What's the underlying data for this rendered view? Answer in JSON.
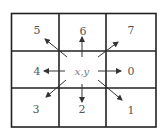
{
  "diagram": {
    "center_label": "x,y",
    "directions": [
      {
        "code": "0",
        "label": "0",
        "direction": "east"
      },
      {
        "code": "1",
        "label": "1",
        "direction": "south-east"
      },
      {
        "code": "2",
        "label": "2",
        "direction": "south"
      },
      {
        "code": "3",
        "label": "3",
        "direction": "south-west"
      },
      {
        "code": "4",
        "label": "4",
        "direction": "west"
      },
      {
        "code": "5",
        "label": "5",
        "direction": "north-west"
      },
      {
        "code": "6",
        "label": "6",
        "direction": "north"
      },
      {
        "code": "7",
        "label": "7",
        "direction": "north-east"
      }
    ],
    "colors": {
      "grid_line": "#222222",
      "arrow": "#333333",
      "label": "#555555",
      "background": "#ffffff"
    }
  }
}
